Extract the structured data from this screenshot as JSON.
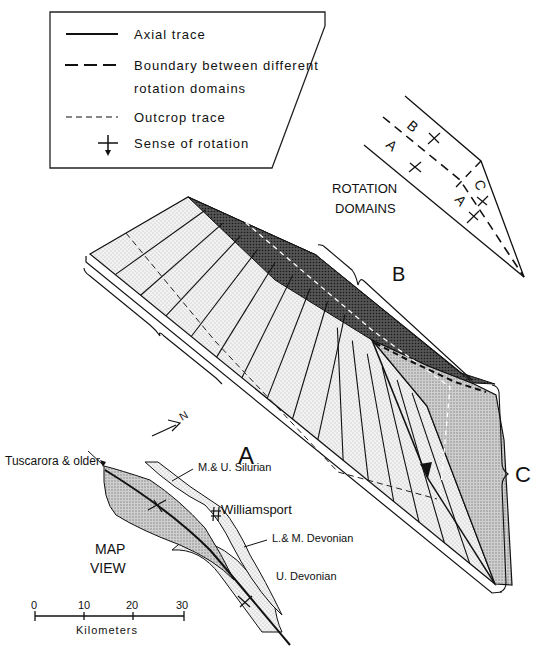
{
  "legend": {
    "items": [
      {
        "symbol": "solid-line",
        "label": "Axial trace"
      },
      {
        "symbol": "long-dash-line",
        "label_line1": "Boundary between different",
        "label_line2": "rotation domains"
      },
      {
        "symbol": "short-dash-line",
        "label": "Outcrop trace"
      },
      {
        "symbol": "cross-arrow",
        "label": "Sense of rotation"
      }
    ]
  },
  "rotation_domains": {
    "title_line1": "ROTATION",
    "title_line2": "DOMAINS",
    "labels": [
      "B",
      "A",
      "C",
      "A"
    ]
  },
  "block_diagram": {
    "brace_labels": [
      "A",
      "B",
      "C"
    ]
  },
  "map_view": {
    "title_line1": "MAP",
    "title_line2": "VIEW",
    "north": "N",
    "labels": {
      "tuscarora": "Tuscarora & older",
      "silurian": "M.& U. Silurian",
      "williamsport": "Williamsport",
      "lm_devonian": "L.& M. Devonian",
      "u_devonian": "U. Devonian"
    },
    "scale": {
      "ticks": [
        "0",
        "10",
        "20",
        "30"
      ],
      "unit": "Kilometers"
    }
  }
}
